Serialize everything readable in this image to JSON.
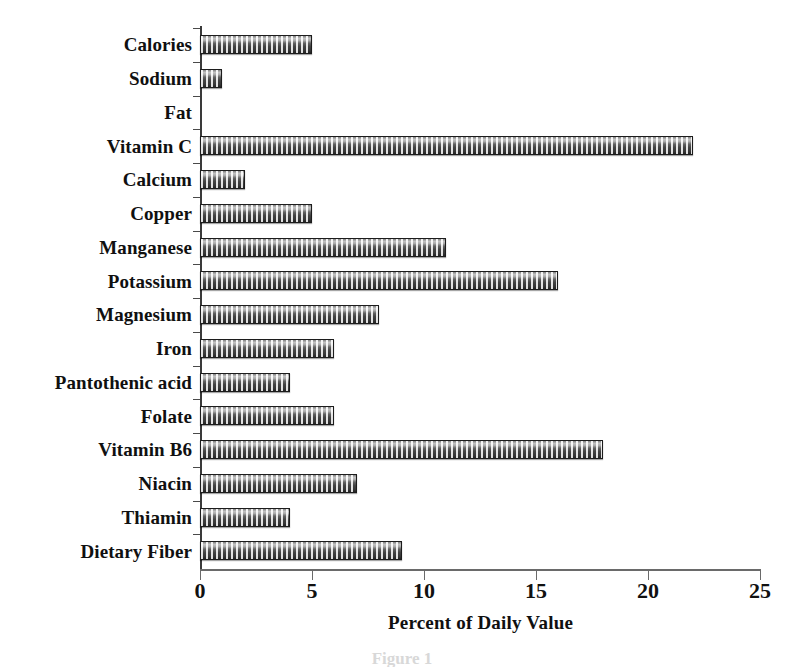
{
  "chart_data": {
    "type": "bar",
    "orientation": "horizontal",
    "title": "",
    "xlabel": "Percent of Daily Value",
    "ylabel": "",
    "xlim": [
      0,
      25
    ],
    "xticks": [
      0,
      5,
      10,
      15,
      20,
      25
    ],
    "grid": false,
    "legend": null,
    "categories": [
      "Calories",
      "Sodium",
      "Fat",
      "Vitamin C",
      "Calcium",
      "Copper",
      "Manganese",
      "Potassium",
      "Magnesium",
      "Iron",
      "Pantothenic acid",
      "Folate",
      "Vitamin B6",
      "Niacin",
      "Thiamin",
      "Dietary Fiber"
    ],
    "values": [
      5,
      1,
      0,
      22,
      2,
      5,
      11,
      16,
      8,
      6,
      4,
      6,
      18,
      7,
      4,
      9
    ]
  },
  "caption": "Figure 1",
  "colors": {
    "bar_fill_dark": "#3b3b3b",
    "bar_fill_light": "#d8d8d8",
    "bar_border": "#1c1c1c",
    "axis": "#6a6a6a",
    "text": "#101010",
    "background": "#ffffff"
  }
}
